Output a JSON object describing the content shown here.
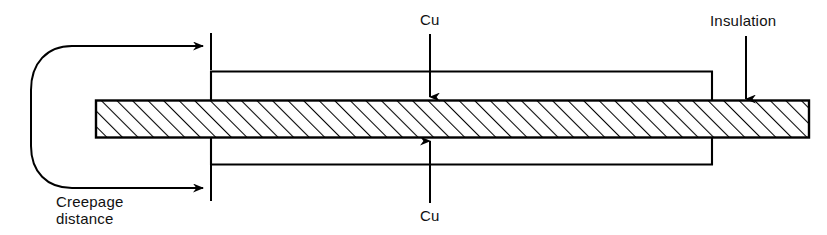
{
  "figure": {
    "type": "technical-cross-section-diagram",
    "width": 827,
    "height": 235,
    "background_color": "#ffffff",
    "line_color": "#000000",
    "text_color": "#111111"
  },
  "labels": {
    "cu_top": "Cu",
    "cu_bottom": "Cu",
    "insulation": "Insulation",
    "creepage_line1": "Creepage",
    "creepage_line2": "distance"
  },
  "parts": {
    "insulation_bar": {
      "name": "Insulation",
      "fill": "hatched-45",
      "x": 95,
      "y": 100,
      "width": 715,
      "height": 38
    },
    "cu_top_layer": {
      "name": "Cu",
      "x": 211,
      "y": 71,
      "width": 501,
      "height": 29
    },
    "cu_bottom_layer": {
      "name": "Cu",
      "x": 211,
      "y": 138,
      "width": 501,
      "height": 27
    }
  },
  "annotations": {
    "creepage_path": {
      "label": "Creepage distance",
      "leftmost_x": 31,
      "top_arrow_y": 46,
      "bottom_arrow_y": 188,
      "arrow_tip_x": 208
    },
    "reference_ticks": {
      "x": 211,
      "top_span": [
        33,
        70
      ],
      "bottom_span": [
        165,
        201
      ]
    },
    "cu_top_leader": {
      "from_y": 34,
      "to_y": 98,
      "x": 430
    },
    "cu_bottom_leader": {
      "from_y": 203,
      "to_y": 141,
      "x": 430
    },
    "insulation_leader": {
      "from_y": 36,
      "to_y": 100,
      "x": 746
    }
  }
}
